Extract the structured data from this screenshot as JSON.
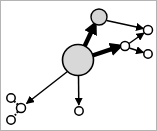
{
  "figure": {
    "width": 157,
    "height": 131,
    "background_color": "#ffffff",
    "border_color": "#b4b4b4"
  },
  "style": {
    "node_fill_large": "#d8d8d8",
    "node_fill_medium": "#d4d4d4",
    "node_fill_small": "#ffffff",
    "node_stroke": "#000000",
    "edge_color": "#000000",
    "edge_thin_width": 1.4,
    "edge_thick_width": 4.2,
    "edge_dotted_width": 1.6
  },
  "graph_data": {
    "type": "node-link-diagram",
    "directed": true,
    "node_count": 9,
    "edge_count": 8,
    "nodes": [
      {
        "id": "n1",
        "label": "",
        "role": "root-hub",
        "cx": 77,
        "cy": 59,
        "r": 15.5,
        "fill": "#d8d8d8",
        "stroke_width": 1.5
      },
      {
        "id": "n2",
        "label": "",
        "role": "secondary-hub",
        "cx": 98,
        "cy": 16,
        "r": 8.0,
        "fill": "#d4d4d4",
        "stroke_width": 1.3
      },
      {
        "id": "n3",
        "label": "",
        "role": "relay",
        "cx": 124,
        "cy": 45,
        "r": 4.5,
        "fill": "#ffffff",
        "stroke_width": 1.4
      },
      {
        "id": "n4",
        "label": "",
        "role": "leaf",
        "cx": 147,
        "cy": 29,
        "r": 4.5,
        "fill": "#ffffff",
        "stroke_width": 1.4
      },
      {
        "id": "n5",
        "label": "",
        "role": "leaf",
        "cx": 147,
        "cy": 53,
        "r": 4.2,
        "fill": "#ffffff",
        "stroke_width": 1.4
      },
      {
        "id": "n6",
        "label": "",
        "role": "leaf",
        "cx": 78,
        "cy": 110,
        "r": 4.2,
        "fill": "#ffffff",
        "stroke_width": 1.4
      },
      {
        "id": "n7",
        "label": "",
        "role": "relay",
        "cx": 20,
        "cy": 107,
        "r": 4.5,
        "fill": "#ffffff",
        "stroke_width": 1.4
      },
      {
        "id": "n8",
        "label": "",
        "role": "leaf",
        "cx": 10,
        "cy": 97,
        "r": 4.2,
        "fill": "#ffffff",
        "stroke_width": 1.4
      },
      {
        "id": "n9",
        "label": "",
        "role": "leaf",
        "cx": 10,
        "cy": 119,
        "r": 4.2,
        "fill": "#ffffff",
        "stroke_width": 1.4
      }
    ],
    "edges": [
      {
        "id": "e1",
        "source": "n1",
        "target": "n2",
        "weight": "heavy",
        "style": "solid",
        "arrow": true
      },
      {
        "id": "e2",
        "source": "n1",
        "target": "n3",
        "weight": "heavy",
        "style": "solid",
        "arrow": true
      },
      {
        "id": "e3",
        "source": "n1",
        "target": "n6",
        "weight": "light",
        "style": "solid",
        "arrow": true
      },
      {
        "id": "e4",
        "source": "n1",
        "target": "n7",
        "weight": "light",
        "style": "solid",
        "arrow": true
      },
      {
        "id": "e5",
        "source": "n2",
        "target": "n4",
        "weight": "light",
        "style": "solid",
        "arrow": true
      },
      {
        "id": "e6",
        "source": "n3",
        "target": "n4",
        "weight": "light",
        "style": "solid",
        "arrow": true
      },
      {
        "id": "e7",
        "source": "n3",
        "target": "n5",
        "weight": "light",
        "style": "solid",
        "arrow": true
      },
      {
        "id": "e8",
        "source": "n7",
        "target": "n8",
        "weight": "light",
        "style": "dotted",
        "arrow": false
      },
      {
        "id": "e9",
        "source": "n7",
        "target": "n9",
        "weight": "light",
        "style": "dotted",
        "arrow": false
      }
    ]
  }
}
